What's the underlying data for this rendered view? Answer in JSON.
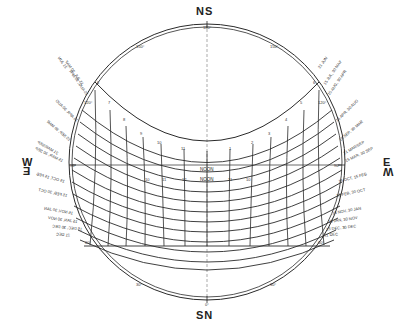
{
  "diagram": {
    "cardinals": {
      "top": "NS",
      "bottom": "SN",
      "left": "WE",
      "right": "EW"
    },
    "azimuth_ticks": {
      "top": "180°",
      "bottom": "0°",
      "left": "90°",
      "right": "90°",
      "upper_left": "150°",
      "upper_right": "150°",
      "upper_left_2": "120°",
      "upper_right_2": "120°",
      "lower_left": "60°",
      "lower_right": "60°",
      "lower_left_2": "30°",
      "lower_right_2": "30°"
    },
    "noon_label": "NOON",
    "hour_labels_top_row": [
      "6",
      "7",
      "8",
      "9",
      "10",
      "11",
      "NOON",
      "1",
      "2",
      "3",
      "4",
      "5",
      "6"
    ],
    "hour_labels_inner_row": [
      "10",
      "11",
      "12",
      "NOON",
      "11",
      "10"
    ],
    "date_lines_right": [
      "21 JUN",
      "15 JUL, 30 MAY",
      "15 AUG, 30 APR",
      "15 APR, 30 AUG",
      "15 SEP, 30 MAR",
      "21 MAR/SEP",
      "15 MAR, 30 SEP",
      "15 OCT, 15 FEB",
      "15 FEB, 30 OCT",
      "15 NOV, 30 JAN",
      "15 JAN, 30 NOV",
      "15 DEC, 30 DEC",
      "21 DEC"
    ],
    "date_lines_left": [
      "21 JUN",
      "15 JUL, 30 MAY",
      "15 AUG, 30 APR",
      "15 APR, 30 AUG",
      "15 SEP, 30 MAR",
      "21 MAR/SEP",
      "15 MAR, 30 SEP",
      "15 OCT, 15 FEB",
      "15 FEB, 30 OCT",
      "15 NOV, 30 JAN",
      "15 JAN, 30 NOV",
      "15 DEC, 30 DEC",
      "21 DEC"
    ],
    "colors": {
      "line": "#2a2a2a",
      "background": "#ffffff"
    }
  }
}
